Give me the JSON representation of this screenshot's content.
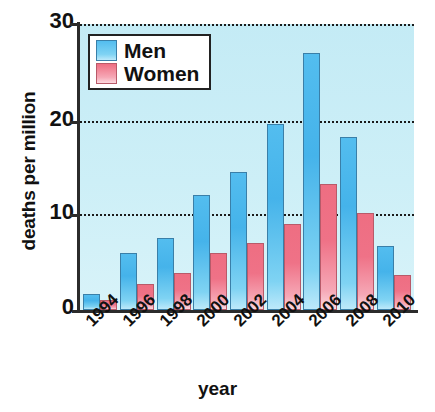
{
  "chart_data": {
    "type": "bar",
    "title": "",
    "xlabel": "year",
    "ylabel": "deaths per million",
    "categories": [
      "1994",
      "1996",
      "1998",
      "2000",
      "2002",
      "2004",
      "2006",
      "2008",
      "2010"
    ],
    "series": [
      {
        "name": "Men",
        "color": "#4fb6e8",
        "values": [
          1.7,
          6.0,
          7.6,
          12.1,
          14.5,
          19.5,
          27.0,
          18.1,
          6.7
        ]
      },
      {
        "name": "Women",
        "color": "#ee6e82",
        "values": [
          1.0,
          2.7,
          3.9,
          6.0,
          7.0,
          9.0,
          13.2,
          10.2,
          3.7
        ]
      }
    ],
    "ylim": [
      0,
      30
    ],
    "yticks": [
      0,
      10,
      20,
      30
    ],
    "ytick_labels": [
      "0",
      "10",
      "20",
      "30"
    ],
    "grid": "horizontal-dotted",
    "gridline_values": [
      10,
      20,
      30
    ],
    "legend_position": "top-left",
    "plot_background": "#cdeff7"
  }
}
